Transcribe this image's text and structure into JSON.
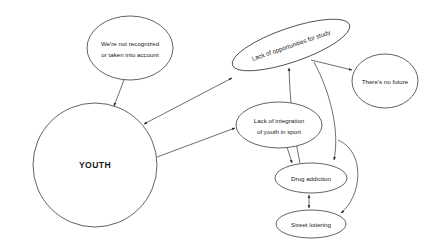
{
  "diagram": {
    "background_color": "#ffffff",
    "stroke_color": "#3a3a3a",
    "edge_color": "#4a4a4a",
    "text_color": "#1a1a1a",
    "nodes": [
      {
        "id": "recognition",
        "label_lines": [
          "We're not recognized",
          "or taken into account"
        ],
        "line1": "We're not recognized",
        "line2": "or taken into account",
        "shape": "ellipse",
        "cx": 130,
        "cy": 48,
        "rx": 43,
        "ry": 32,
        "rotation": 0
      },
      {
        "id": "study",
        "label_lines": [
          "Lack of opportunities for study"
        ],
        "line1": "Lack of opportunities for study",
        "shape": "ellipse",
        "cx": 291,
        "cy": 45,
        "rx": 62,
        "ry": 17,
        "rotation": -19
      },
      {
        "id": "future",
        "label_lines": [
          "There's no future"
        ],
        "line1": "There's no future",
        "shape": "ellipse",
        "cx": 385,
        "cy": 81,
        "rx": 33,
        "ry": 27,
        "rotation": 0
      },
      {
        "id": "youth",
        "label_lines": [
          "YOUTH"
        ],
        "line1": "YOUTH",
        "shape": "circle",
        "cx": 95,
        "cy": 165,
        "rx": 62,
        "ry": 62,
        "rotation": 0
      },
      {
        "id": "sport",
        "label_lines": [
          "Lack of integration",
          "of youth in sport"
        ],
        "line1": "Lack of integration",
        "line2": "of youth in sport",
        "shape": "ellipse",
        "cx": 279,
        "cy": 125,
        "rx": 43,
        "ry": 23,
        "rotation": 0
      },
      {
        "id": "drugs",
        "label_lines": [
          "Drug addiction"
        ],
        "line1": "Drug addiction",
        "shape": "ellipse",
        "cx": 311,
        "cy": 178,
        "rx": 36,
        "ry": 15,
        "rotation": 0
      },
      {
        "id": "loitering",
        "label_lines": [
          "Street loitering"
        ],
        "line1": "Street loitering",
        "shape": "ellipse",
        "cx": 311,
        "cy": 224,
        "rx": 35,
        "ry": 14,
        "rotation": 0
      }
    ],
    "edges": [
      {
        "id": "recognition-to-youth",
        "from": "recognition",
        "to": "youth",
        "direction": "one-way"
      },
      {
        "id": "youth-to-study",
        "from": "youth",
        "to": "study",
        "direction": "two-way"
      },
      {
        "id": "youth-to-sport",
        "from": "youth",
        "to": "sport",
        "direction": "one-way"
      },
      {
        "id": "study-to-future",
        "from": "study",
        "to": "future",
        "direction": "one-way"
      },
      {
        "id": "study-to-drugs",
        "from": "study",
        "to": "drugs",
        "direction": "one-way"
      },
      {
        "id": "drugs-to-study",
        "from": "drugs",
        "to": "study",
        "direction": "one-way"
      },
      {
        "id": "sport-to-drugs",
        "from": "sport",
        "to": "drugs",
        "direction": "one-way"
      },
      {
        "id": "drugs-to-loitering",
        "from": "drugs",
        "to": "loitering",
        "direction": "two-way"
      },
      {
        "id": "study-to-loitering",
        "from": "study",
        "to": "loitering",
        "direction": "one-way"
      }
    ]
  }
}
